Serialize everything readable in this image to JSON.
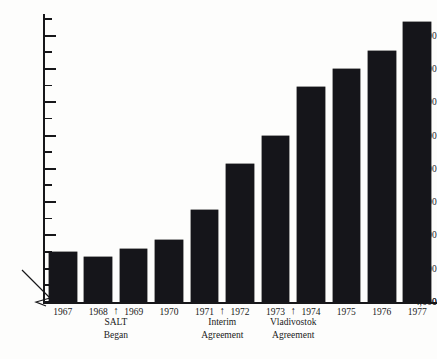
{
  "chart_data": {
    "type": "bar",
    "title": "",
    "subtitle": "",
    "xlabel": "",
    "ylabel": "",
    "categories": [
      "1967",
      "1968",
      "1969",
      "1970",
      "1971",
      "1972",
      "1973",
      "1974",
      "1975",
      "1976",
      "1977"
    ],
    "values": [
      5500,
      5350,
      5600,
      5850,
      6750,
      8150,
      9000,
      10450,
      11000,
      11550,
      12400
    ],
    "series": [
      {
        "name": "Strategic nuclear warheads",
        "values": [
          5500,
          5350,
          5600,
          5850,
          6750,
          8150,
          9000,
          10450,
          11000,
          11550,
          12400
        ]
      }
    ],
    "ylim": [
      4000,
      12650
    ],
    "y_axis_broken": true,
    "y_break_between": [
      0,
      4000
    ],
    "y_major_ticks": [
      4000,
      5000,
      6000,
      7000,
      8000,
      9000,
      10000,
      11000,
      12000
    ],
    "y_major_tick_labels": [
      "4,000",
      "5,000",
      "6,000",
      "7,000",
      "8,000",
      "9,000",
      "10,000",
      "11,000",
      "12,000"
    ],
    "y_minor_tick_interval": 500,
    "y_zero_label": "0",
    "grid": false,
    "legend": false,
    "legend_position": "none",
    "bar_color": "#15151a",
    "background_color": "#fdfdfc",
    "axis_color": "#17171a",
    "annotations": [
      {
        "name": "salt-began",
        "line1": "SALT",
        "line2": "Began",
        "arrow": "↑",
        "between": [
          "1968",
          "1969"
        ],
        "center_category_index": 1.5
      },
      {
        "name": "interim-agreement",
        "line1": "Interim",
        "line2": "Agreement",
        "arrow": "↑",
        "between": [
          "1971",
          "1972"
        ],
        "center_category_index": 4.5
      },
      {
        "name": "vladivostok-agreement",
        "line1": "Vladivostok",
        "line2": "Agreement",
        "arrow": "↑",
        "between": [
          "1973",
          "1974"
        ],
        "center_category_index": 6.5
      }
    ]
  }
}
